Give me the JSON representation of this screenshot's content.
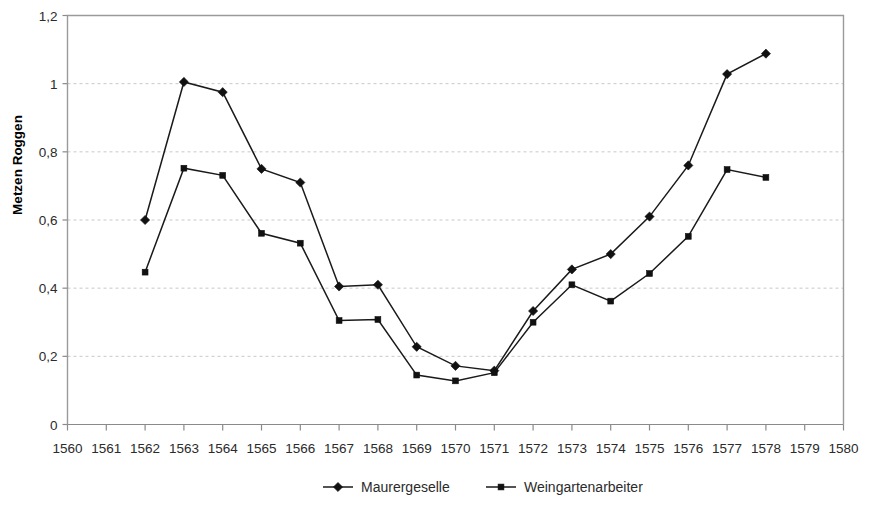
{
  "chart_data": {
    "type": "line",
    "title": "",
    "xlabel": "",
    "ylabel": "Metzen Roggen",
    "xlim": [
      1560,
      1580
    ],
    "ylim": [
      0,
      1.2
    ],
    "grid": true,
    "legend_position": "bottom",
    "x": [
      1560,
      1561,
      1562,
      1563,
      1564,
      1565,
      1566,
      1567,
      1568,
      1569,
      1570,
      1571,
      1572,
      1573,
      1574,
      1575,
      1576,
      1577,
      1578,
      1579,
      1580
    ],
    "xtick_labels": [
      "1560",
      "1561",
      "1562",
      "1563",
      "1564",
      "1565",
      "1566",
      "1567",
      "1568",
      "1569",
      "1570",
      "1571",
      "1572",
      "1573",
      "1574",
      "1575",
      "1576",
      "1577",
      "1578",
      "1579",
      "1580"
    ],
    "ytick_labels": [
      "0",
      "0,2",
      "0,4",
      "0,6",
      "0,8",
      "1",
      "1,2"
    ],
    "ytick_values": [
      0,
      0.2,
      0.4,
      0.6,
      0.8,
      1.0,
      1.2
    ],
    "series": [
      {
        "name": "Maurergeselle",
        "marker": "diamond",
        "color": "#111111",
        "x": [
          1562,
          1563,
          1564,
          1565,
          1566,
          1567,
          1568,
          1569,
          1570,
          1571,
          1572,
          1573,
          1574,
          1575,
          1576,
          1577,
          1578
        ],
        "values": [
          0.6,
          1.005,
          0.975,
          0.75,
          0.71,
          0.405,
          0.41,
          0.228,
          0.172,
          0.158,
          0.333,
          0.455,
          0.5,
          0.61,
          0.76,
          1.028,
          1.088
        ]
      },
      {
        "name": "Weingartenarbeiter",
        "marker": "square",
        "color": "#111111",
        "x": [
          1562,
          1563,
          1564,
          1565,
          1566,
          1567,
          1568,
          1569,
          1570,
          1571,
          1572,
          1573,
          1574,
          1575,
          1576,
          1577,
          1578
        ],
        "values": [
          0.447,
          0.752,
          0.731,
          0.561,
          0.532,
          0.305,
          0.308,
          0.145,
          0.128,
          0.152,
          0.3,
          0.41,
          0.362,
          0.443,
          0.552,
          0.748,
          0.725
        ]
      }
    ]
  },
  "legend": {
    "items": [
      {
        "label": "Maurergeselle",
        "marker": "diamond"
      },
      {
        "label": "Weingartenarbeiter",
        "marker": "square"
      }
    ]
  },
  "axes": {
    "y_title": "Metzen Roggen"
  }
}
